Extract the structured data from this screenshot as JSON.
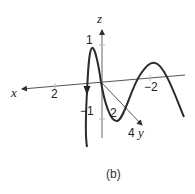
{
  "figure": {
    "caption": "(b)",
    "axes": {
      "x": {
        "label": "x",
        "ticks": [
          {
            "label": "2"
          },
          {
            "label": "−2"
          }
        ]
      },
      "y": {
        "label": "y",
        "ticks": [
          {
            "label": "2"
          },
          {
            "label": "4"
          }
        ]
      },
      "z": {
        "label": "z",
        "ticks": [
          {
            "label": "1"
          },
          {
            "label": "−1"
          }
        ]
      }
    },
    "curve": {
      "description": "Space curve oscillating in z while advancing along the x-y plane, with a direction arrow pointing downward near the start",
      "color": "#2b2b2b"
    },
    "axis_color": "#555555"
  }
}
